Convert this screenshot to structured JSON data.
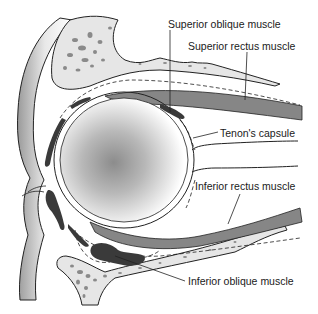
{
  "diagram": {
    "labels": {
      "superior_oblique": "Superior oblique muscle",
      "superior_rectus": "Superior rectus muscle",
      "tenons_capsule": "Tenon's capsule",
      "inferior_rectus": "Inferior rectus muscle",
      "inferior_oblique": "Inferior oblique muscle"
    },
    "colors": {
      "bone_fill": "#e6e6e6",
      "bone_spot": "#8a8a8a",
      "muscle_dark": "#3a3a3a",
      "muscle_striation": "#6a6a6a",
      "line": "#222222",
      "globe_center": "#8c8c8c",
      "background": "#ffffff"
    }
  }
}
